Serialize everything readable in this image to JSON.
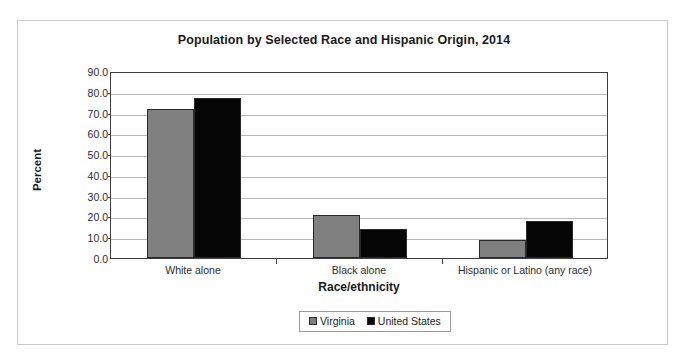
{
  "chart_data": {
    "type": "bar",
    "title": "Population by Selected Race and Hispanic Origin, 2014",
    "xlabel": "Race/ethnicity",
    "ylabel": "Percent",
    "categories": [
      "White alone",
      "Black alone",
      "Hispanic or Latino (any race)"
    ],
    "series": [
      {
        "name": "Virginia",
        "color": "#808080",
        "values": [
          71.7,
          20.7,
          8.7
        ]
      },
      {
        "name": "United States",
        "color": "#050505",
        "values": [
          77.0,
          14.0,
          17.8
        ]
      }
    ],
    "ylim": [
      0.0,
      90.0
    ],
    "ytick_step": 10.0,
    "ytick_labels": [
      "0.0",
      "10.0",
      "20.0",
      "30.0",
      "40.0",
      "50.0",
      "60.0",
      "70.0",
      "80.0",
      "90.0"
    ],
    "grid": true,
    "legend_position": "bottom"
  },
  "legend": {
    "entries": [
      {
        "label": "Virginia"
      },
      {
        "label": "United States"
      }
    ]
  }
}
